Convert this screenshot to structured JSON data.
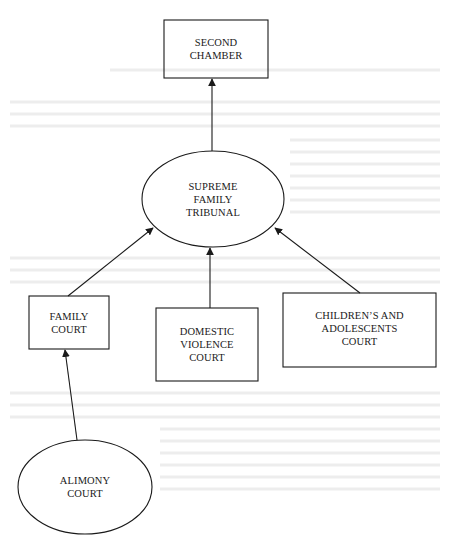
{
  "diagram": {
    "type": "hierarchy",
    "colors": {
      "stroke": "#1a1a1a",
      "background": "#ffffff",
      "bleed_text": "#e6e6e6"
    },
    "nodes": [
      {
        "id": "second-chamber",
        "shape": "rect",
        "label": "SECOND\nCHAMBER"
      },
      {
        "id": "supreme-family-tribunal",
        "shape": "ellipse",
        "label": "SUPREME\nFAMILY\nTRIBUNAL"
      },
      {
        "id": "family-court",
        "shape": "rect",
        "label": "FAMILY\nCOURT"
      },
      {
        "id": "domestic-violence-court",
        "shape": "rect",
        "label": "DOMESTIC\nVIOLENCE\nCOURT"
      },
      {
        "id": "childrens-adolescents-court",
        "shape": "rect",
        "label": "CHILDREN’S AND\nADOLESCENTS\nCOURT"
      },
      {
        "id": "alimony-court",
        "shape": "ellipse",
        "label": "ALIMONY\nCOURT"
      }
    ],
    "edges": [
      {
        "from": "supreme-family-tribunal",
        "to": "second-chamber"
      },
      {
        "from": "family-court",
        "to": "supreme-family-tribunal"
      },
      {
        "from": "domestic-violence-court",
        "to": "supreme-family-tribunal"
      },
      {
        "from": "childrens-adolescents-court",
        "to": "supreme-family-tribunal"
      },
      {
        "from": "alimony-court",
        "to": "family-court"
      }
    ]
  }
}
